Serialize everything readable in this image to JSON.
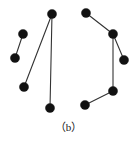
{
  "figure": {
    "caption": "（b）",
    "background_color": "#ffffff",
    "node_color": "#111111",
    "edge_color": "#333333",
    "canvas": {
      "width": 137,
      "height": 142
    }
  },
  "diagram_data": {
    "type": "node-link-graph",
    "node_radius": 4.6,
    "edge_width": 1.1,
    "clusters": [
      {
        "name": "left-cluster",
        "nodes": [
          {
            "id": "L1",
            "x": 23,
            "y": 34
          },
          {
            "id": "L2",
            "x": 15,
            "y": 58
          },
          {
            "id": "L3",
            "x": 52,
            "y": 14
          },
          {
            "id": "L4",
            "x": 24,
            "y": 87
          },
          {
            "id": "L5",
            "x": 50,
            "y": 108
          }
        ],
        "edges": [
          {
            "from": "L1",
            "to": "L2"
          },
          {
            "from": "L3",
            "to": "L4"
          },
          {
            "from": "L3",
            "to": "L5"
          }
        ]
      },
      {
        "name": "right-cluster",
        "nodes": [
          {
            "id": "R1",
            "x": 86,
            "y": 13
          },
          {
            "id": "R2",
            "x": 113,
            "y": 34
          },
          {
            "id": "R3",
            "x": 124,
            "y": 60
          },
          {
            "id": "R4",
            "x": 113,
            "y": 91
          },
          {
            "id": "R5",
            "x": 85,
            "y": 105
          }
        ],
        "edges": [
          {
            "from": "R1",
            "to": "R2"
          },
          {
            "from": "R2",
            "to": "R3"
          },
          {
            "from": "R2",
            "to": "R4"
          },
          {
            "from": "R4",
            "to": "R5"
          }
        ]
      }
    ]
  }
}
